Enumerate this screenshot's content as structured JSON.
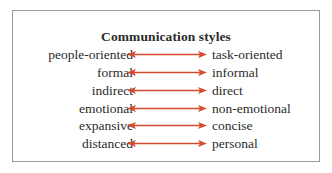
{
  "diagram": {
    "title": "Communication styles",
    "arrow_color": "#d64a2e",
    "border_color": "#9a9a9a",
    "text_color": "#2b2b2b",
    "rows": [
      {
        "left": "people-oriented",
        "right": "task-oriented"
      },
      {
        "left": "formal",
        "right": "informal"
      },
      {
        "left": "indirect",
        "right": "direct"
      },
      {
        "left": "emotional",
        "right": "non-emotional"
      },
      {
        "left": "expansive",
        "right": "concise"
      },
      {
        "left": "distanced",
        "right": "personal"
      }
    ]
  }
}
